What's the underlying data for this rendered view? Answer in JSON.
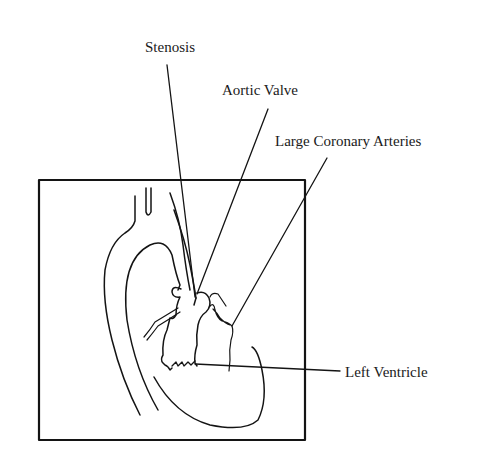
{
  "diagram": {
    "labels": [
      {
        "id": "stenosis",
        "text": "Stenosis"
      },
      {
        "id": "aortic-valve",
        "text": "Aortic Valve"
      },
      {
        "id": "large-coronary-arteries",
        "text": "Large Coronary Arteries"
      },
      {
        "id": "left-ventricle",
        "text": "Left Ventricle"
      }
    ],
    "colors": {
      "line": "#141414",
      "background": "#ffffff"
    }
  }
}
